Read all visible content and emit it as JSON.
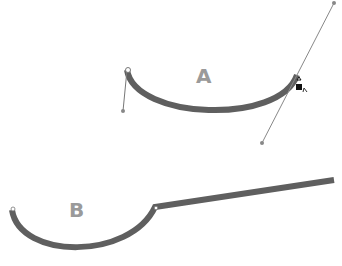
{
  "labels": {
    "a": "A",
    "b": "B"
  },
  "colors": {
    "stroke": "#666666",
    "handle": "#777777",
    "label": "#9a9a9a"
  }
}
